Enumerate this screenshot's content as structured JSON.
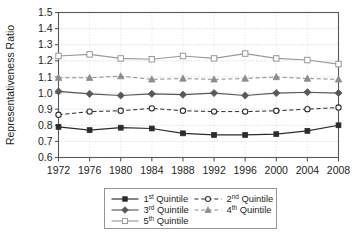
{
  "chart_data": {
    "type": "line",
    "title": "",
    "xlabel": "",
    "ylabel": "Representativeness Ratio",
    "x": [
      1972,
      1976,
      1980,
      1984,
      1988,
      1992,
      1996,
      2000,
      2004,
      2008
    ],
    "xticklabels": [
      "1972",
      "1976",
      "1980",
      "1984",
      "1988",
      "1992",
      "1996",
      "2000",
      "2004",
      "2008"
    ],
    "yticklabels": [
      "0.6",
      "0.7",
      "0.8",
      "0.9",
      "1.0",
      "1.1",
      "1.2",
      "1.3",
      "1.4",
      "1.5"
    ],
    "yticks": [
      0.6,
      0.7,
      0.8,
      0.9,
      1.0,
      1.1,
      1.2,
      1.3,
      1.4,
      1.5
    ],
    "ylim": [
      0.6,
      1.5
    ],
    "xlim": [
      1972,
      2008
    ],
    "grid": true,
    "legend_position": "bottom",
    "series": [
      {
        "name": "1st Quintile",
        "name_base": "1",
        "name_sup": "st",
        "name_rest": " Quintile",
        "marker": "filled-square",
        "linestyle": "solid",
        "color": "#2b2b2b",
        "values": [
          0.79,
          0.77,
          0.785,
          0.78,
          0.75,
          0.74,
          0.74,
          0.745,
          0.765,
          0.8
        ]
      },
      {
        "name": "2nd Quintile",
        "name_base": "2",
        "name_sup": "nd",
        "name_rest": " Quintile",
        "marker": "open-circle",
        "linestyle": "dashed",
        "color": "#2b2b2b",
        "values": [
          0.865,
          0.885,
          0.89,
          0.905,
          0.89,
          0.885,
          0.885,
          0.89,
          0.9,
          0.91
        ]
      },
      {
        "name": "3rd Quintile",
        "name_base": "3",
        "name_sup": "rd",
        "name_rest": " Quintile",
        "marker": "filled-diamond",
        "linestyle": "solid",
        "color": "#58585a",
        "values": [
          1.01,
          0.995,
          0.985,
          0.995,
          0.99,
          1.0,
          0.985,
          1.0,
          1.005,
          1.0
        ]
      },
      {
        "name": "4th Quintile",
        "name_base": "4",
        "name_sup": "th",
        "name_rest": " Quintile",
        "marker": "filled-triangle",
        "linestyle": "dashed",
        "color": "#8c8c8e",
        "values": [
          1.095,
          1.095,
          1.105,
          1.085,
          1.09,
          1.085,
          1.09,
          1.1,
          1.09,
          1.085
        ]
      },
      {
        "name": "5th Quintile",
        "name_base": "5",
        "name_sup": "th",
        "name_rest": " Quintile",
        "marker": "open-square",
        "linestyle": "solid",
        "color": "#9a9a9c",
        "values": [
          1.23,
          1.24,
          1.215,
          1.21,
          1.23,
          1.215,
          1.245,
          1.215,
          1.205,
          1.18
        ]
      }
    ]
  }
}
